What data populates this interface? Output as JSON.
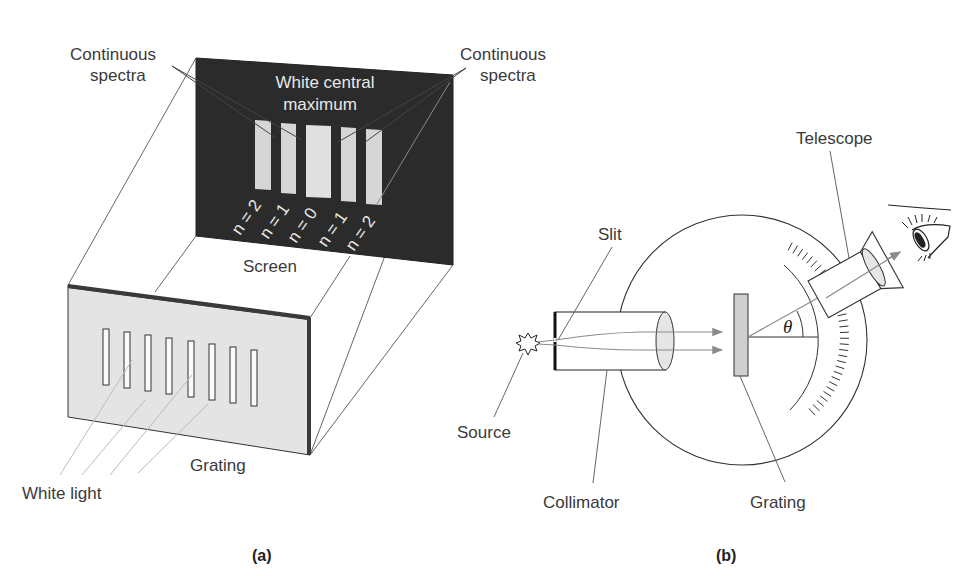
{
  "panel_a": {
    "caption": "(a)",
    "labels": {
      "continuous_spectra_left_1": "Continuous",
      "continuous_spectra_left_2": "spectra",
      "continuous_spectra_right_1": "Continuous",
      "continuous_spectra_right_2": "spectra",
      "central_max_1": "White central",
      "central_max_2": "maximum",
      "screen": "Screen",
      "grating": "Grating",
      "white_light": "White light"
    },
    "orders": [
      "n = 2",
      "n = 1",
      "n = 0",
      "n = 1",
      "n = 2"
    ],
    "slit_count": 8,
    "colors": {
      "screen": "#2b2b2b",
      "bands": "#d9d9d9",
      "grating": "#e2e2e2",
      "grating_edge": "#3a3a3a"
    }
  },
  "panel_b": {
    "caption": "(b)",
    "labels": {
      "telescope": "Telescope",
      "slit": "Slit",
      "source": "Source",
      "collimator": "Collimator",
      "grating": "Grating",
      "angle": "θ"
    },
    "colors": {
      "grating": "#cfcfcf",
      "lens": "#e6e6e6",
      "ray": "#8a8a8a"
    }
  }
}
